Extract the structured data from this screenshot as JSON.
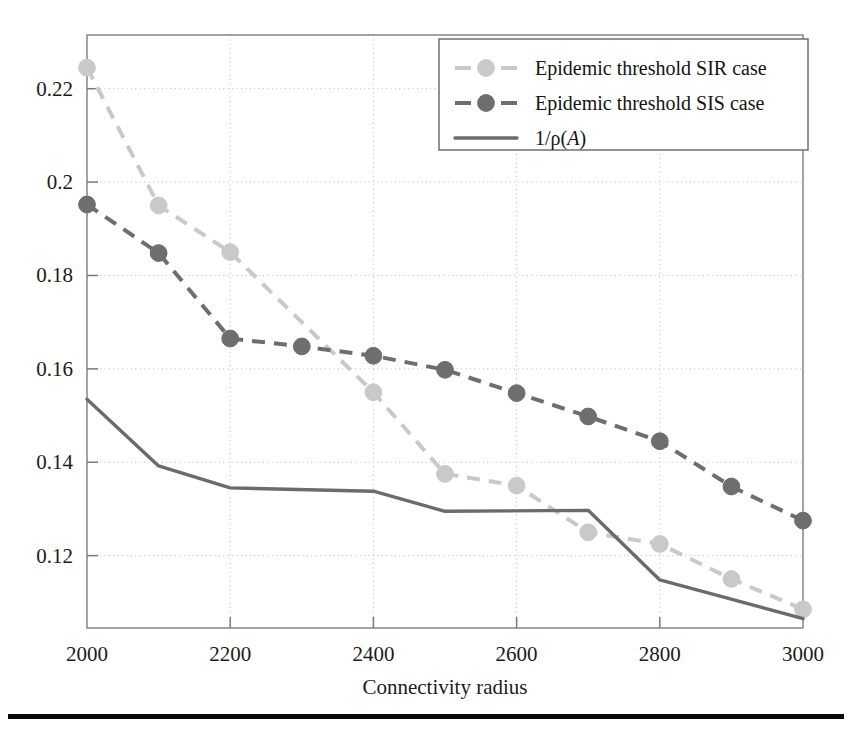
{
  "chart_data": {
    "type": "line",
    "title": "",
    "xlabel": "Connectivity radius",
    "ylabel": "",
    "xlim": [
      2000,
      3000
    ],
    "ylim": [
      0.1045,
      0.2315
    ],
    "grid": true,
    "legend_position": "top-right",
    "x_ticks": [
      "2000",
      "2200",
      "2400",
      "2600",
      "2800",
      "3000"
    ],
    "x_tick_values": [
      2000,
      2200,
      2400,
      2600,
      2800,
      3000
    ],
    "y_ticks": [
      "0.12",
      "0.14",
      "0.16",
      "0.18",
      "0.2",
      "0.22"
    ],
    "y_tick_values": [
      0.12,
      0.14,
      0.16,
      0.18,
      0.2,
      0.22
    ],
    "x": [
      2000,
      2100,
      2200,
      2300,
      2400,
      2500,
      2600,
      2700,
      2800,
      2900,
      3000
    ],
    "series": [
      {
        "name": "Epidemic threshold SIR case",
        "style": "dashed-marker",
        "color": "#c9c9c9",
        "marker": "circle",
        "x": [
          2000,
          2100,
          2200,
          2400,
          2500,
          2600,
          2700,
          2800,
          2900,
          3000
        ],
        "values": [
          0.2245,
          0.195,
          0.185,
          0.155,
          0.1375,
          0.135,
          0.125,
          0.1225,
          0.115,
          0.1085
        ]
      },
      {
        "name": "Epidemic threshold SIS case",
        "style": "dashed-marker",
        "color": "#6e6e6e",
        "marker": "circle",
        "x": [
          2000,
          2100,
          2200,
          2300,
          2400,
          2500,
          2600,
          2700,
          2800,
          2900,
          3000
        ],
        "values": [
          0.1952,
          0.1848,
          0.1665,
          0.1648,
          0.1628,
          0.1598,
          0.1548,
          0.1498,
          0.1445,
          0.1348,
          0.1275
        ]
      },
      {
        "name": "1/ρ(A)",
        "style": "solid",
        "color": "#6b6b6b",
        "marker": "none",
        "x": [
          2000,
          2100,
          2200,
          2400,
          2500,
          2700,
          2800,
          3000
        ],
        "values": [
          0.1535,
          0.1392,
          0.1345,
          0.1338,
          0.1295,
          0.1297,
          0.1148,
          0.1065
        ]
      }
    ],
    "legend": [
      {
        "label": "Epidemic threshold SIR case",
        "color": "#c9c9c9",
        "style": "dashed-marker"
      },
      {
        "label": "Epidemic threshold SIS case",
        "color": "#6e6e6e",
        "style": "dashed-marker"
      },
      {
        "label": "1/ρ(A)",
        "color": "#6b6b6b",
        "style": "solid",
        "math": true
      }
    ]
  },
  "legend_math": {
    "prefix": "1/ρ(",
    "italic": "A",
    "suffix": ")"
  },
  "colors": {
    "sir": "#c9c9c9",
    "sis": "#6e6e6e",
    "rho": "#6b6b6b",
    "frame": "#8d8d8d",
    "grid": "#b9b9b9",
    "rule": "#0a0a0a"
  }
}
